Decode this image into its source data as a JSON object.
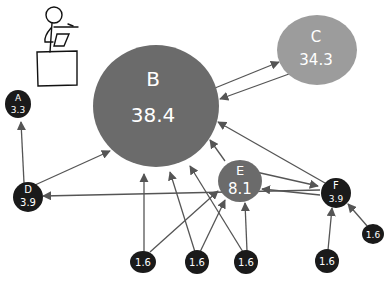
{
  "diagram": {
    "type": "pagerank-graph",
    "colors": {
      "edge": "#555555",
      "arrowhead": "#555555",
      "node_B": "#6b6b6b",
      "node_C": "#9c9c9c",
      "node_E": "#6b6b6b",
      "node_small": "#1a1a1a",
      "label": "#ffffff",
      "figure": "#111111"
    },
    "nodes": [
      {
        "id": "A",
        "label": "A",
        "value": "3.3"
      },
      {
        "id": "B",
        "label": "B",
        "value": "38.4"
      },
      {
        "id": "C",
        "label": "C",
        "value": "34.3"
      },
      {
        "id": "D",
        "label": "D",
        "value": "3.9"
      },
      {
        "id": "E",
        "label": "E",
        "value": "8.1"
      },
      {
        "id": "F",
        "label": "F",
        "value": "3.9"
      },
      {
        "id": "G1",
        "label": "",
        "value": "1.6"
      },
      {
        "id": "G2",
        "label": "",
        "value": "1.6"
      },
      {
        "id": "G3",
        "label": "",
        "value": "1.6"
      },
      {
        "id": "G4",
        "label": "",
        "value": "1.6"
      },
      {
        "id": "G5",
        "label": "",
        "value": "1.6"
      }
    ],
    "edges": [
      {
        "from": "B",
        "to": "C"
      },
      {
        "from": "C",
        "to": "B"
      },
      {
        "from": "D",
        "to": "A"
      },
      {
        "from": "D",
        "to": "B"
      },
      {
        "from": "E",
        "to": "B"
      },
      {
        "from": "F",
        "to": "B"
      },
      {
        "from": "E",
        "to": "F"
      },
      {
        "from": "F",
        "to": "E"
      },
      {
        "from": "F",
        "to": "D"
      },
      {
        "from": "G1",
        "to": "B"
      },
      {
        "from": "G1",
        "to": "E"
      },
      {
        "from": "G2",
        "to": "B"
      },
      {
        "from": "G2",
        "to": "E"
      },
      {
        "from": "G3",
        "to": "B"
      },
      {
        "from": "G3",
        "to": "E"
      },
      {
        "from": "G4",
        "to": "F"
      },
      {
        "from": "G5",
        "to": "F"
      }
    ],
    "illustration": "stick-figure-at-podium"
  }
}
